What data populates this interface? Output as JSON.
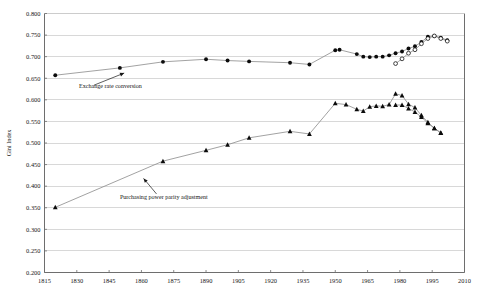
{
  "chart_data": {
    "type": "line",
    "title": "",
    "subtitle": "",
    "xlabel": "",
    "ylabel": "Gini Index",
    "xlim": [
      1815,
      2010
    ],
    "ylim": [
      0.2,
      0.8
    ],
    "grid": true,
    "legend_position": "none",
    "x_ticks": [
      1815,
      1830,
      1845,
      1860,
      1875,
      1890,
      1905,
      1920,
      1935,
      1950,
      1965,
      1980,
      1995,
      2010
    ],
    "y_ticks": [
      0.2,
      0.25,
      0.3,
      0.35,
      0.4,
      0.45,
      0.5,
      0.55,
      0.6,
      0.65,
      0.7,
      0.75,
      0.8
    ],
    "x_tick_labels": [
      "1815",
      "1830",
      "1845",
      "1860",
      "1875",
      "1890",
      "1905",
      "1920",
      "1935",
      "1950",
      "1965",
      "1980",
      "1995",
      "2010"
    ],
    "y_tick_labels": [
      "0.200",
      "0.250",
      "0.300",
      "0.350",
      "0.400",
      "0.450",
      "0.500",
      "0.550",
      "0.600",
      "0.650",
      "0.700",
      "0.750",
      "0.800"
    ],
    "series": [
      {
        "name": "Exchange rate conversion",
        "marker": "circle-filled",
        "points": [
          [
            1820,
            0.657
          ],
          [
            1850,
            0.674
          ],
          [
            1870,
            0.688
          ],
          [
            1890,
            0.694
          ],
          [
            1900,
            0.691
          ],
          [
            1910,
            0.689
          ],
          [
            1929,
            0.686
          ],
          [
            1938,
            0.682
          ],
          [
            1950,
            0.715
          ],
          [
            1952,
            0.716
          ],
          [
            1960,
            0.706
          ],
          [
            1963,
            0.7
          ],
          [
            1966,
            0.699
          ],
          [
            1969,
            0.7
          ],
          [
            1972,
            0.7
          ],
          [
            1975,
            0.703
          ],
          [
            1978,
            0.708
          ],
          [
            1981,
            0.712
          ],
          [
            1984,
            0.719
          ],
          [
            1987,
            0.724
          ],
          [
            1990,
            0.734
          ],
          [
            1993,
            0.746
          ],
          [
            1996,
            0.748
          ],
          [
            1999,
            0.744
          ],
          [
            2002,
            0.738
          ]
        ]
      },
      {
        "name": "Exchange rate conversion (alternative estimate)",
        "marker": "circle-open",
        "points": [
          [
            1978,
            0.684
          ],
          [
            1981,
            0.695
          ],
          [
            1984,
            0.708
          ],
          [
            1987,
            0.716
          ],
          [
            1990,
            0.73
          ],
          [
            1993,
            0.742
          ],
          [
            1996,
            0.748
          ],
          [
            1999,
            0.742
          ],
          [
            2002,
            0.736
          ]
        ]
      },
      {
        "name": "Purchasing power parity adjustment",
        "marker": "triangle-filled",
        "points": [
          [
            1820,
            0.351
          ],
          [
            1870,
            0.458
          ],
          [
            1890,
            0.483
          ],
          [
            1900,
            0.496
          ],
          [
            1910,
            0.512
          ],
          [
            1929,
            0.527
          ],
          [
            1938,
            0.521
          ],
          [
            1950,
            0.592
          ],
          [
            1955,
            0.589
          ],
          [
            1960,
            0.578
          ],
          [
            1963,
            0.574
          ],
          [
            1966,
            0.584
          ],
          [
            1969,
            0.586
          ],
          [
            1972,
            0.585
          ],
          [
            1975,
            0.589
          ],
          [
            1978,
            0.614
          ],
          [
            1981,
            0.61
          ],
          [
            1984,
            0.59
          ],
          [
            1987,
            0.582
          ],
          [
            1990,
            0.564
          ],
          [
            1993,
            0.548
          ],
          [
            1996,
            0.534
          ],
          [
            1999,
            0.524
          ]
        ]
      },
      {
        "name": "Purchasing power parity adjustment (alternative estimate)",
        "marker": "triangle-filled",
        "points": [
          [
            1978,
            0.588
          ],
          [
            1981,
            0.588
          ],
          [
            1984,
            0.58
          ],
          [
            1987,
            0.572
          ],
          [
            1990,
            0.56
          ],
          [
            1993,
            0.546
          ],
          [
            1996,
            0.534
          ],
          [
            1999,
            0.523
          ]
        ]
      }
    ],
    "annotations": [
      {
        "text": "Exchange rate conversion",
        "text_x": 1831,
        "text_y": 0.627,
        "arrow_from_x": 1838,
        "arrow_from_y": 0.634,
        "arrow_to_x": 1852,
        "arrow_to_y": 0.662
      },
      {
        "text": "Purchasing power parity adjustment",
        "text_x": 1850,
        "text_y": 0.371,
        "arrow_from_x": 1867,
        "arrow_from_y": 0.382,
        "arrow_to_x": 1861,
        "arrow_to_y": 0.418
      }
    ]
  }
}
